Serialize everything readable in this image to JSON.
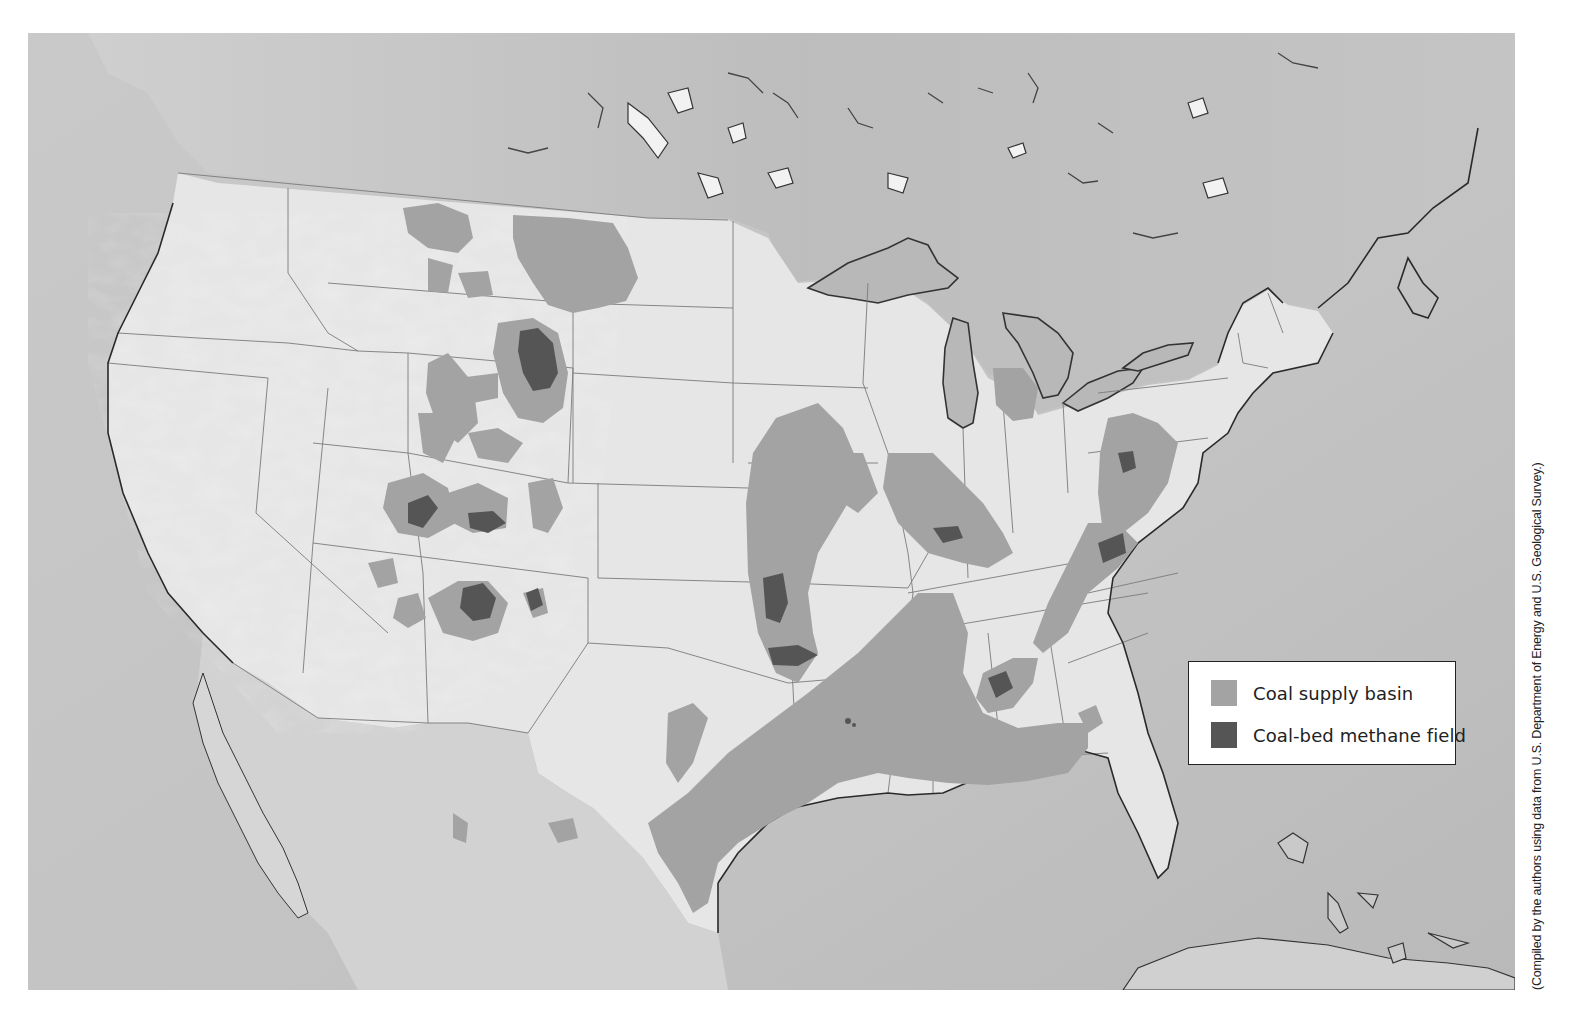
{
  "map": {
    "title": "Coal supply basins and coal-bed methane fields of the United States",
    "region": "Contiguous United States with southern Canada, northern Mexico, Gulf of Mexico and Caribbean",
    "colors": {
      "ocean": "#c4c4c4",
      "land_us": "#e6e6e6",
      "land_canada": "#bdbdbd",
      "land_mexico": "#cfcfcf",
      "great_lakes": "#b8b8b8",
      "coal_supply_basin": "#a3a3a3",
      "coal_bed_methane_field": "#555555",
      "coastline": "#333333",
      "state_border": "#777777"
    },
    "features": {
      "coal_supply_basins": [
        "Powder River Basin (Montana/Wyoming)",
        "Fort Union / Williston Basin (North Dakota/Montana)",
        "Green River Basin (Wyoming)",
        "Wind River / Bighorn Basins (Wyoming)",
        "Uinta Basin (Utah/Colorado)",
        "Piceance Basin (Colorado)",
        "San Juan Basin (New Mexico/Colorado)",
        "Raton Basin (Colorado/New Mexico)",
        "Black Mesa (Arizona)",
        "Western Interior Basin (Iowa/Missouri/Kansas/Oklahoma)",
        "Illinois Basin (Illinois/Indiana/Kentucky)",
        "Michigan Basin",
        "Northern Appalachian Basin (Pennsylvania/Ohio/West Virginia)",
        "Central Appalachian Basin (Kentucky/Virginia)",
        "Black Warrior Basin (Alabama)",
        "Gulf Coast Lignite Belt (Texas/Louisiana/Mississippi/Alabama)",
        "Fort Worth area (Texas)"
      ],
      "coal_bed_methane_fields": [
        "Powder River Basin",
        "Uinta Basin",
        "Piceance Basin",
        "San Juan Basin",
        "Raton Basin",
        "Cherokee / Arkoma Basins (Kansas/Oklahoma)",
        "Illinois Basin",
        "Northern Appalachian Basin",
        "Central Appalachian Basin",
        "Black Warrior Basin",
        "Gulf Coast (Arkansas/Louisiana)"
      ]
    }
  },
  "legend": {
    "items": [
      {
        "label": "Coal supply basin",
        "swatch_color": "#a3a3a3"
      },
      {
        "label": "Coal-bed methane field",
        "swatch_color": "#555555"
      }
    ]
  },
  "credit": "(Compiled by the authors using data from U.S. Department of Energy and U.S. Geological Survey.)"
}
